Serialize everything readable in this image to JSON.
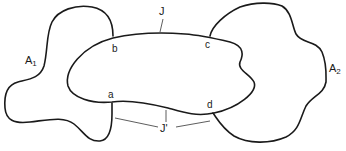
{
  "diagram": {
    "regions": [
      {
        "id": "A1",
        "label": "A",
        "subscript": "1"
      },
      {
        "id": "A2",
        "label": "A",
        "subscript": "2"
      }
    ],
    "curves": [
      {
        "id": "J",
        "label": "J"
      },
      {
        "id": "J_prime",
        "label": "J'"
      }
    ],
    "points": [
      {
        "id": "a",
        "label": "a"
      },
      {
        "id": "b",
        "label": "b"
      },
      {
        "id": "c",
        "label": "c"
      },
      {
        "id": "d",
        "label": "d"
      }
    ],
    "colors": {
      "stroke": "#1a1a1a",
      "background": "#ffffff"
    }
  }
}
